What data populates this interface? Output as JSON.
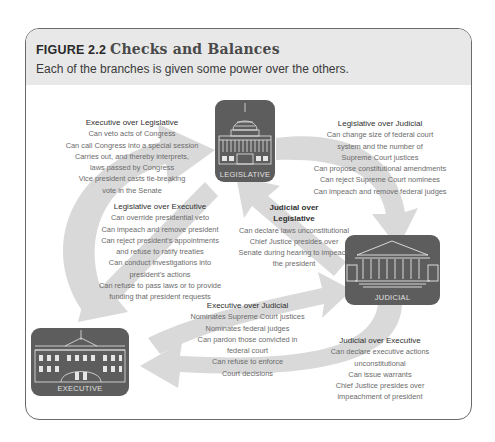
{
  "figure": {
    "label": "FIGURE 2.2",
    "title": "Checks and Balances",
    "caption": "Each of the branches is given some power over the others."
  },
  "branches": {
    "legislative": {
      "label": "LEGISLATIVE",
      "icon": "capitol-building-icon"
    },
    "judicial": {
      "label": "JUDICIAL",
      "icon": "supreme-court-building-icon"
    },
    "executive": {
      "label": "EXECUTIVE",
      "icon": "white-house-icon"
    }
  },
  "checks": {
    "exec_over_leg": {
      "heading": "Executive over Legislative",
      "lines": [
        "Can veto acts of Congress",
        "Can call Congress into a special session",
        "Carries out, and thereby interprets,",
        "laws passed by Congress",
        "Vice president casts tie-breaking",
        "vote in the Senate"
      ]
    },
    "leg_over_jud": {
      "heading": "Legislative over Judicial",
      "lines": [
        "Can change size of federal court",
        "system and the number of",
        "Supreme Court justices",
        "Can propose constitutional amendments",
        "Can reject Supreme Court nominees",
        "Can impeach and remove federal judges"
      ]
    },
    "leg_over_exec": {
      "heading": "Legislative over Executive",
      "lines": [
        "Can override presidential veto",
        "Can impeach and remove president",
        "Can reject president's appointments",
        "and refuse to ratify treaties",
        "Can conduct investigations into",
        "president's actions",
        "Can refuse to pass laws or to provide",
        "funding that president requests"
      ]
    },
    "jud_over_leg": {
      "heading_lines": [
        "Judicial over",
        "Legislative"
      ],
      "lines": [
        "Can declare laws unconstitutional",
        "Chief Justice presides over",
        "Senate during hearing to impeach",
        "the president"
      ]
    },
    "exec_over_jud": {
      "heading": "Executive over Judicial",
      "lines": [
        "Nominates Supreme Court justices",
        "Nominates federal judges",
        "Can pardon those convicted in",
        "federal court",
        "Can refuse to enforce",
        "Court decisions"
      ]
    },
    "jud_over_exec": {
      "heading": "Judicial over Executive",
      "lines": [
        "Can declare executive actions",
        "unconstitutional",
        "Can issue warrants",
        "Chief Justice presides over",
        "impeachment of president"
      ]
    }
  },
  "colors": {
    "header_band": "#e8e8e8",
    "arrow": "#d6d6d6",
    "building_box": "#5d5d5d"
  }
}
